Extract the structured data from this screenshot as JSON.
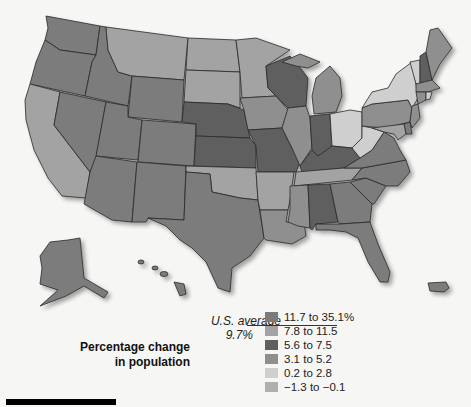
{
  "legend": {
    "title_line1": "Percentage change",
    "title_line2": "in population",
    "us_average_label": "U.S. average",
    "us_average_value": "9.7%",
    "items": [
      {
        "label": "11.7 to 35.1%",
        "color": "#7b7b7b"
      },
      {
        "label": "7.8 to 11.5",
        "color": "#a3a3a3"
      },
      {
        "label": "5.6 to 7.5",
        "color": "#5f5f5f"
      },
      {
        "label": "3.1 to 5.2",
        "color": "#8f8f8f"
      },
      {
        "label": "0.2 to 2.8",
        "color": "#cfcfcf"
      },
      {
        "label": "−1.3 to −0.1",
        "color": "#b0b0b0"
      }
    ]
  },
  "states": {
    "WA": "11.7 to 35.1%",
    "OR": "11.7 to 35.1%",
    "CA": "7.8 to 11.5",
    "NV": "11.7 to 35.1%",
    "ID": "11.7 to 35.1%",
    "MT": "7.8 to 11.5",
    "WY": "11.7 to 35.1%",
    "UT": "11.7 to 35.1%",
    "AZ": "11.7 to 35.1%",
    "CO": "11.7 to 35.1%",
    "NM": "11.7 to 35.1%",
    "ND": "7.8 to 11.5",
    "SD": "7.8 to 11.5",
    "NE": "5.6 to 7.5",
    "KS": "5.6 to 7.5",
    "OK": "7.8 to 11.5",
    "TX": "11.7 to 35.1%",
    "MN": "7.8 to 11.5",
    "IA": "3.1 to 5.2",
    "MO": "5.6 to 7.5",
    "AR": "7.8 to 11.5",
    "LA": "3.1 to 5.2",
    "WI": "5.6 to 7.5",
    "IL": "3.1 to 5.2",
    "MI": "3.1 to 5.2",
    "IN": "5.6 to 7.5",
    "OH": "0.2 to 2.8",
    "KY": "5.6 to 7.5",
    "TN": "7.8 to 11.5",
    "MS": "3.1 to 5.2",
    "AL": "5.6 to 7.5",
    "GA": "11.7 to 35.1%",
    "FL": "11.7 to 35.1%",
    "SC": "11.7 to 35.1%",
    "NC": "11.7 to 35.1%",
    "VA": "11.7 to 35.1%",
    "WV": "0.2 to 2.8",
    "PA": "3.1 to 5.2",
    "NY": "0.2 to 2.8",
    "VT": "0.2 to 2.8",
    "NH": "5.6 to 7.5",
    "ME": "3.1 to 5.2",
    "MA": "3.1 to 5.2",
    "CT": "3.1 to 5.2",
    "RI": "0.2 to 2.8",
    "NJ": "3.1 to 5.2",
    "DE": "11.7 to 35.1%",
    "MD": "7.8 to 11.5",
    "AK": "11.7 to 35.1%",
    "HI": "11.7 to 35.1%",
    "PR": "11.7 to 35.1%"
  }
}
